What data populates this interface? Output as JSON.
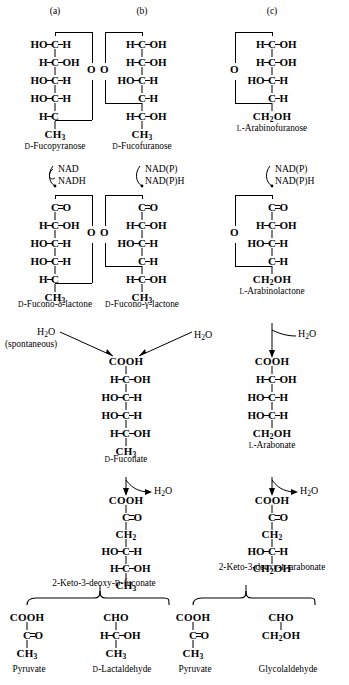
{
  "figure": {
    "panels": [
      {
        "letter": "(a)"
      },
      {
        "letter": "(b)"
      },
      {
        "letter": "(c)"
      }
    ]
  },
  "row1": {
    "a": {
      "name_prefix": "D",
      "name": "-Fucopyranose",
      "ring_oxygen": "O",
      "carbons": [
        {
          "left": "HO",
          "center": "C",
          "right": "H"
        },
        {
          "left": "H",
          "center": "C",
          "right": "OH"
        },
        {
          "left": "HO",
          "center": "C",
          "right": "H"
        },
        {
          "left": "HO",
          "center": "C",
          "right": "H"
        },
        {
          "left": "H",
          "center": "C",
          "right": ""
        },
        {
          "left": "",
          "center": "CH3",
          "right": ""
        }
      ]
    },
    "b": {
      "name_prefix": "D",
      "name": "-Fucofuranose",
      "ring_oxygen": "O",
      "carbons": [
        {
          "left": "H",
          "center": "C",
          "right": "OH"
        },
        {
          "left": "H",
          "center": "C",
          "right": "OH"
        },
        {
          "left": "HO",
          "center": "C",
          "right": "H"
        },
        {
          "left": "",
          "center": "C",
          "right": "H"
        },
        {
          "left": "H",
          "center": "C",
          "right": "OH"
        },
        {
          "left": "",
          "center": "CH3",
          "right": ""
        }
      ]
    },
    "c": {
      "name_prefix": "L",
      "name": "-Arabinofuranose",
      "ring_oxygen": "O",
      "carbons": [
        {
          "left": "H",
          "center": "C",
          "right": "OH"
        },
        {
          "left": "H",
          "center": "C",
          "right": "OH"
        },
        {
          "left": "HO",
          "center": "C",
          "right": "H"
        },
        {
          "left": "",
          "center": "C",
          "right": "H"
        },
        {
          "left": "",
          "center": "CH2OH",
          "right": ""
        }
      ]
    }
  },
  "row2": {
    "a": {
      "cofactor_in": "NAD",
      "cofactor_out": "NADH",
      "name_prefix": "D",
      "name": "-Fucono-δ-lactone",
      "ring_oxygen": "O",
      "carbons": [
        {
          "left": "",
          "center": "C",
          "right": "=O"
        },
        {
          "left": "H",
          "center": "C",
          "right": "OH"
        },
        {
          "left": "HO",
          "center": "C",
          "right": "H"
        },
        {
          "left": "HO",
          "center": "C",
          "right": "H"
        },
        {
          "left": "H",
          "center": "C",
          "right": ""
        },
        {
          "left": "",
          "center": "CH3",
          "right": ""
        }
      ]
    },
    "b": {
      "cofactor_in": "NAD(P)",
      "cofactor_out": "NAD(P)H",
      "name_prefix": "D",
      "name": "-Fucono-γ-lactone",
      "ring_oxygen": "O",
      "carbons": [
        {
          "left": "",
          "center": "C",
          "right": "=O"
        },
        {
          "left": "H",
          "center": "C",
          "right": "OH"
        },
        {
          "left": "HO",
          "center": "C",
          "right": "H"
        },
        {
          "left": "",
          "center": "C",
          "right": "H"
        },
        {
          "left": "H",
          "center": "C",
          "right": "OH"
        },
        {
          "left": "",
          "center": "CH3",
          "right": ""
        }
      ]
    },
    "c": {
      "cofactor_in": "NAD(P)",
      "cofactor_out": "NAD(P)H",
      "name_prefix": "L",
      "name": "-Arabinolactone",
      "ring_oxygen": "O",
      "carbons": [
        {
          "left": "",
          "center": "C",
          "right": "=O"
        },
        {
          "left": "H",
          "center": "C",
          "right": "OH"
        },
        {
          "left": "HO",
          "center": "C",
          "right": "H"
        },
        {
          "left": "",
          "center": "C",
          "right": "H"
        },
        {
          "left": "",
          "center": "CH2OH",
          "right": ""
        }
      ]
    }
  },
  "row3": {
    "left": {
      "water_left": "H2O",
      "water_right": "H2O",
      "spontaneous": "(spontaneous)",
      "name_prefix": "D",
      "name": "-Fuconate",
      "carbons": [
        {
          "left": "",
          "center": "COOH",
          "right": ""
        },
        {
          "left": "H",
          "center": "C",
          "right": "OH"
        },
        {
          "left": "HO",
          "center": "C",
          "right": "H"
        },
        {
          "left": "HO",
          "center": "C",
          "right": "H"
        },
        {
          "left": "H",
          "center": "C",
          "right": "OH"
        },
        {
          "left": "",
          "center": "CH3",
          "right": ""
        }
      ]
    },
    "right": {
      "water": "H2O",
      "name_prefix": "L",
      "name": "-Arabonate",
      "carbons": [
        {
          "left": "",
          "center": "COOH",
          "right": ""
        },
        {
          "left": "H",
          "center": "C",
          "right": "OH"
        },
        {
          "left": "HO",
          "center": "C",
          "right": "H"
        },
        {
          "left": "HO",
          "center": "C",
          "right": "H"
        },
        {
          "left": "",
          "center": "CH2OH",
          "right": ""
        }
      ]
    }
  },
  "row4": {
    "left": {
      "water": "H2O",
      "name": "2-Keto-3-deoxy-",
      "name_prefix": "D",
      "name_suffix": "-fuconate",
      "carbons": [
        {
          "left": "",
          "center": "COOH",
          "right": ""
        },
        {
          "left": "",
          "center": "C",
          "right": "=O"
        },
        {
          "left": "",
          "center": "CH2",
          "right": ""
        },
        {
          "left": "HO",
          "center": "C",
          "right": "H"
        },
        {
          "left": "H",
          "center": "C",
          "right": "OH"
        },
        {
          "left": "",
          "center": "CH3",
          "right": ""
        }
      ]
    },
    "right": {
      "water": "H2O",
      "name": "2-Keto-3-deoxy-",
      "name_prefix": "L",
      "name_suffix": "-arabonate",
      "carbons": [
        {
          "left": "",
          "center": "COOH",
          "right": ""
        },
        {
          "left": "",
          "center": "C",
          "right": "=O"
        },
        {
          "left": "",
          "center": "CH2",
          "right": ""
        },
        {
          "left": "HO",
          "center": "C",
          "right": "H"
        },
        {
          "left": "",
          "center": "CH2OH",
          "right": ""
        }
      ]
    }
  },
  "row5": {
    "left_pyruvate": {
      "name": "Pyruvate",
      "carbons": [
        {
          "left": "",
          "center": "COOH",
          "right": ""
        },
        {
          "left": "",
          "center": "C",
          "right": "=O"
        },
        {
          "left": "",
          "center": "CH3",
          "right": ""
        }
      ]
    },
    "lactaldehyde": {
      "name_prefix": "D",
      "name": "-Lactaldehyde",
      "carbons": [
        {
          "left": "",
          "center": "CHO",
          "right": ""
        },
        {
          "left": "H",
          "center": "C",
          "right": "OH"
        },
        {
          "left": "",
          "center": "CH3",
          "right": ""
        }
      ]
    },
    "right_pyruvate": {
      "name": "Pyruvate",
      "carbons": [
        {
          "left": "",
          "center": "COOH",
          "right": ""
        },
        {
          "left": "",
          "center": "C",
          "right": "=O"
        },
        {
          "left": "",
          "center": "CH3",
          "right": ""
        }
      ]
    },
    "glycolaldehyde": {
      "name": "Glycolaldehyde",
      "carbons": [
        {
          "left": "",
          "center": "CHO",
          "right": ""
        },
        {
          "left": "",
          "center": "CH2OH",
          "right": ""
        }
      ]
    }
  }
}
